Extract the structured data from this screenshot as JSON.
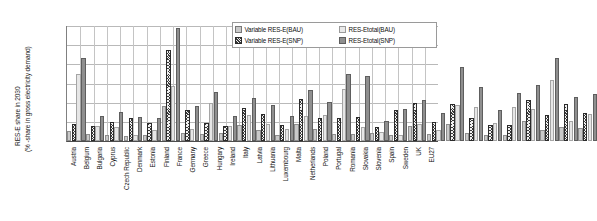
{
  "chart_data": {
    "type": "bar",
    "title": "",
    "xlabel": "",
    "ylabel_line1": "RES-E share in 2030",
    "ylabel_line2": "(% -share in gross electricity demand)",
    "ylim": [
      0,
      120
    ],
    "ytick_labels": [
      "120%",
      "100%",
      "80%",
      "60%",
      "40%",
      "20%",
      "0%"
    ],
    "ytick_values": [
      120,
      100,
      80,
      60,
      40,
      20,
      0
    ],
    "grid": true,
    "legend_position": "top-right",
    "categories": [
      "Austria",
      "Belgium",
      "Bulgaria",
      "Cyprus",
      "Czech Republic",
      "Denmark",
      "Estonia",
      "Finland",
      "France",
      "Germany",
      "Greece",
      "Hungary",
      "Ireland",
      "Italy",
      "Latvia",
      "Lithuania",
      "Luxembourg",
      "Malta",
      "Netherlands",
      "Poland",
      "Portugal",
      "Romania",
      "Slovakia",
      "Slovenia",
      "Spain",
      "Sweden",
      "UK",
      "EU27"
    ],
    "series": [
      {
        "name": "Variable RES-E(BAU)",
        "key": "vbau",
        "color": "#c9c9c9",
        "values": [
          8,
          5,
          4,
          3,
          4,
          34,
          6,
          5,
          6,
          15,
          9,
          4,
          16,
          10,
          5,
          5,
          6,
          4,
          14,
          5,
          16,
          6,
          4,
          4,
          19,
          9,
          13,
          11
        ]
      },
      {
        "name": "Variable RES-E(SNP)",
        "key": "vsnp",
        "color": "#3a3a3a",
        "values": [
          16,
          14,
          18,
          22,
          17,
          93,
          30,
          17,
          14,
          32,
          26,
          15,
          42,
          22,
          22,
          23,
          13,
          30,
          38,
          18,
          37,
          22,
          15,
          15,
          41,
          25,
          37,
          27
        ]
      },
      {
        "name": "RES-Etotal(BAU)",
        "key": "tbau",
        "color": "#e6e6e6",
        "values": [
          68,
          14,
          13,
          4,
          9,
          55,
          10,
          38,
          14,
          25,
          16,
          10,
          24,
          25,
          52,
          13,
          7,
          4,
          16,
          9,
          36,
          33,
          17,
          33,
          31,
          62,
          19,
          26
        ]
      },
      {
        "name": "RES-Etotal(SNP)",
        "key": "tsnp",
        "color": "#8f8f8f",
        "values": [
          85,
          24,
          28,
          23,
          22,
          116,
          34,
          49,
          24,
          43,
          35,
          24,
          51,
          39,
          68,
          66,
          19,
          31,
          41,
          27,
          75,
          54,
          30,
          48,
          56,
          85,
          44,
          47
        ]
      }
    ]
  }
}
